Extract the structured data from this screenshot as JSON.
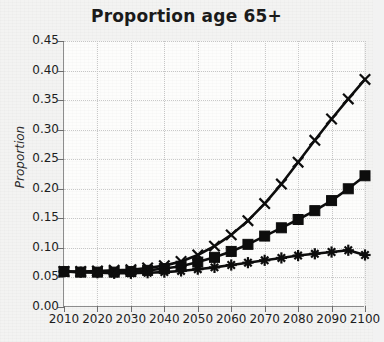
{
  "chart_data": {
    "type": "line",
    "title": "Proportion age 65+",
    "xlabel": "",
    "ylabel": "Proportion",
    "grid": true,
    "legend": "none",
    "xlim": [
      2010,
      2100
    ],
    "ylim": [
      0.0,
      0.45
    ],
    "x_tick_labels": [
      "2010",
      "2020",
      "2030",
      "2040",
      "2050",
      "2060",
      "2070",
      "2080",
      "2090",
      "2100"
    ],
    "x_ticks": [
      2010,
      2020,
      2030,
      2040,
      2050,
      2060,
      2070,
      2080,
      2090,
      2100
    ],
    "y_tick_labels": [
      "0.45",
      "0.40",
      "0.35",
      "0.30",
      "0.25",
      "0.20",
      "0.15",
      "0.10",
      "0.05",
      "0.00"
    ],
    "y_ticks": [
      0.45,
      0.4,
      0.35,
      0.3,
      0.25,
      0.2,
      0.15,
      0.1,
      0.05,
      0.0
    ],
    "x": [
      2010,
      2015,
      2020,
      2025,
      2030,
      2035,
      2040,
      2045,
      2050,
      2055,
      2060,
      2065,
      2070,
      2075,
      2080,
      2085,
      2090,
      2095,
      2100
    ],
    "series": [
      {
        "name": "high-growth",
        "marker": "x",
        "values": [
          0.06,
          0.06,
          0.061,
          0.062,
          0.063,
          0.066,
          0.07,
          0.077,
          0.088,
          0.103,
          0.122,
          0.146,
          0.175,
          0.208,
          0.245,
          0.282,
          0.318,
          0.352,
          0.385
        ]
      },
      {
        "name": "medium-growth",
        "marker": "square",
        "values": [
          0.06,
          0.059,
          0.059,
          0.059,
          0.06,
          0.062,
          0.065,
          0.069,
          0.076,
          0.084,
          0.094,
          0.106,
          0.12,
          0.134,
          0.148,
          0.163,
          0.18,
          0.2,
          0.222
        ]
      },
      {
        "name": "low-growth",
        "marker": "plus",
        "values": [
          0.06,
          0.059,
          0.058,
          0.057,
          0.057,
          0.058,
          0.059,
          0.061,
          0.064,
          0.067,
          0.071,
          0.075,
          0.079,
          0.083,
          0.087,
          0.09,
          0.093,
          0.096,
          0.088
        ]
      }
    ]
  }
}
